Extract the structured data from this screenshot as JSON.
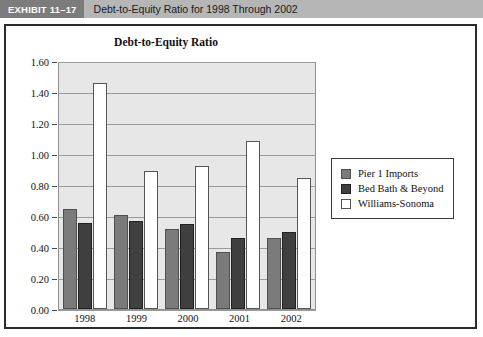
{
  "header": {
    "badge": "EXHIBIT 11–17",
    "title": "Debt-to-Equity Ratio for 1998 Through 2002",
    "badge_bg": "#7c7c7c",
    "bar_bg": "#b6b6b6"
  },
  "chart_data": {
    "type": "bar",
    "title": "Debt-to-Equity Ratio",
    "xlabel": "",
    "ylabel": "",
    "categories": [
      "1998",
      "1999",
      "2000",
      "2001",
      "2002"
    ],
    "series": [
      {
        "name": "Pier 1 Imports",
        "color": "#7b7b7b",
        "values": [
          0.65,
          0.61,
          0.52,
          0.37,
          0.46
        ]
      },
      {
        "name": "Bed Bath & Beyond",
        "color": "#3f3f3f",
        "values": [
          0.56,
          0.57,
          0.55,
          0.46,
          0.5
        ]
      },
      {
        "name": "Williams-Sonoma",
        "color": "#ffffff",
        "values": [
          1.47,
          0.9,
          0.93,
          1.09,
          0.85
        ]
      }
    ],
    "ylim": [
      0.0,
      1.6
    ],
    "ytick_step": 0.2,
    "ytick_labels": [
      "0.00",
      "0.20",
      "0.40",
      "0.60",
      "0.80",
      "1.00",
      "1.20",
      "1.40",
      "1.60"
    ],
    "grid": true,
    "legend_position": "right",
    "plot_background": "#e7e7e7",
    "gridline_color": "#9a9a9a"
  }
}
